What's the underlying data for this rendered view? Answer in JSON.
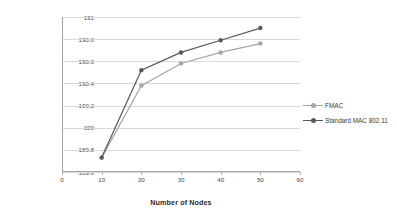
{
  "chart_data": {
    "type": "line",
    "title": "",
    "xlabel": "Number of Nodes",
    "ylabel": "Average Energy Consumed (mJ)",
    "x": [
      10,
      20,
      30,
      40,
      50
    ],
    "xlim": [
      0,
      60
    ],
    "ylim": [
      189.6,
      191.0
    ],
    "xticks": [
      "0",
      "10",
      "20",
      "30",
      "40",
      "50",
      "60"
    ],
    "xtick_values": [
      0,
      10,
      20,
      30,
      40,
      50,
      60
    ],
    "yticks": [
      "189.6",
      "189.8",
      "190",
      "190.2",
      "190.4",
      "190.6",
      "190.8",
      "191"
    ],
    "ytick_values": [
      189.6,
      189.8,
      190.0,
      190.2,
      190.4,
      190.6,
      190.8,
      191.0
    ],
    "grid": true,
    "legend_position": "right",
    "series": [
      {
        "name": "FMAC",
        "color": "#a6a6a6",
        "marker": "circle",
        "values": [
          189.73,
          190.38,
          190.58,
          190.68,
          190.76
        ]
      },
      {
        "name": "Standard MAC 802.11",
        "color": "#595959",
        "marker": "circle",
        "values": [
          189.73,
          190.52,
          190.68,
          190.79,
          190.9
        ]
      }
    ]
  },
  "legend": {
    "items": [
      {
        "label": "FMAC"
      },
      {
        "label": "Standard MAC 802.11"
      }
    ]
  },
  "axes": {
    "x_title": "Number of Nodes",
    "y_title": "Average Energy Consumed (mJ)"
  }
}
